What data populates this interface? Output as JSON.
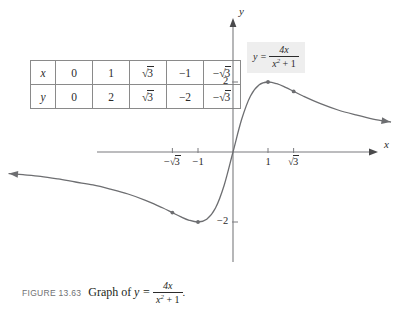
{
  "figure": {
    "caption_number": "FIGURE 13.63",
    "caption_text": "Graph of",
    "caption_equation_lhs": "y =",
    "caption_equation_numerator": "4x",
    "caption_equation_denominator": "x2 + 1",
    "caption_period": "."
  },
  "equation_callout": {
    "lhs": "y =",
    "numerator": "4x",
    "denominator_base": "x",
    "denominator_exp": "2",
    "denominator_rest": " + 1"
  },
  "table": {
    "row_x_header": "x",
    "row_y_header": "y",
    "row_x_values": [
      "0",
      "1",
      "√3",
      "−1",
      "−√3"
    ],
    "row_y_values": [
      "0",
      "2",
      "√3",
      "−2",
      "−√3"
    ]
  },
  "axes": {
    "x_axis_label": "x",
    "y_axis_label": "y",
    "x_ticks": [
      {
        "value": -1.7320508,
        "label": "−√3"
      },
      {
        "value": -1,
        "label": "−1"
      },
      {
        "value": 1,
        "label": "1"
      },
      {
        "value": 1.7320508,
        "label": "√3"
      }
    ],
    "y_ticks": [
      {
        "value": 2,
        "label": "2"
      },
      {
        "value": -2,
        "label": "−2"
      }
    ]
  },
  "chart_data": {
    "type": "line",
    "function": "y = 4x / (x^2 + 1)",
    "xlabel": "x",
    "ylabel": "y",
    "xlim": [
      -6.6,
      4.9
    ],
    "ylim": [
      -4.2,
      4.2
    ],
    "grid": false,
    "legend": "none",
    "curve_color": "#6d6e71",
    "axis_color": "#7a7b7e",
    "marked_points": [
      {
        "x": 1,
        "y": 2
      },
      {
        "x": 1.7320508,
        "y": 1.7320508
      },
      {
        "x": -1,
        "y": -2
      },
      {
        "x": -1.7320508,
        "y": -1.7320508
      }
    ],
    "domain_plotted": [
      -6.4,
      4.5
    ],
    "points": [
      {
        "x": -6.4,
        "y": -0.6163
      },
      {
        "x": -6.0,
        "y": -0.6486
      },
      {
        "x": -5.5,
        "y": -0.6949
      },
      {
        "x": -5.0,
        "y": -0.7692
      },
      {
        "x": -4.5,
        "y": -0.8571
      },
      {
        "x": -4.0,
        "y": -0.9412
      },
      {
        "x": -3.5,
        "y": -1.0619
      },
      {
        "x": -3.0,
        "y": -1.2
      },
      {
        "x": -2.5,
        "y": -1.3793
      },
      {
        "x": -2.2,
        "y": -1.5106
      },
      {
        "x": -2.0,
        "y": -1.6
      },
      {
        "x": -1.7320508,
        "y": -1.7320508
      },
      {
        "x": -1.5,
        "y": -1.8462
      },
      {
        "x": -1.25,
        "y": -1.9512
      },
      {
        "x": -1.0,
        "y": -2.0
      },
      {
        "x": -0.75,
        "y": -1.92
      },
      {
        "x": -0.5,
        "y": -1.6
      },
      {
        "x": -0.25,
        "y": -0.9412
      },
      {
        "x": 0,
        "y": 0
      },
      {
        "x": 0.25,
        "y": 0.9412
      },
      {
        "x": 0.5,
        "y": 1.6
      },
      {
        "x": 0.75,
        "y": 1.92
      },
      {
        "x": 1.0,
        "y": 2.0
      },
      {
        "x": 1.25,
        "y": 1.9512
      },
      {
        "x": 1.5,
        "y": 1.8462
      },
      {
        "x": 1.7320508,
        "y": 1.7320508
      },
      {
        "x": 2.0,
        "y": 1.6
      },
      {
        "x": 2.5,
        "y": 1.3793
      },
      {
        "x": 3.0,
        "y": 1.2
      },
      {
        "x": 3.5,
        "y": 1.0619
      },
      {
        "x": 4.0,
        "y": 0.9412
      },
      {
        "x": 4.5,
        "y": 0.8571
      }
    ]
  },
  "geometry": {
    "origin_x": 233,
    "origin_y": 152,
    "unit_px": 35,
    "x_axis_start": 97,
    "x_axis_end": 378,
    "y_axis_top": 18,
    "y_axis_bottom": 262
  }
}
